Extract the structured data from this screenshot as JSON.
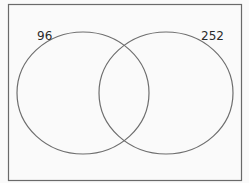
{
  "diagram": {
    "type": "venn",
    "frame": {
      "stroke": "#6a6a6a",
      "fill": "#fafafa"
    },
    "sets": [
      {
        "id": "left",
        "label": "96",
        "stroke": "#6e6e6e"
      },
      {
        "id": "right",
        "label": "252",
        "stroke": "#6e6e6e"
      }
    ]
  }
}
